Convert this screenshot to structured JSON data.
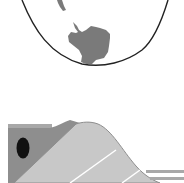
{
  "figure": {
    "colors": {
      "background": "#ffffff",
      "globe_outline": "#222222",
      "landmass": "#7a7a7a",
      "block_face": "#c8c8c8",
      "block_side": "#8e8e8e",
      "block_stripe": "#ffffff",
      "lines": "#a8a8a8",
      "dark_oval": "#111111"
    },
    "globe": {
      "label": "globe-bottom",
      "continents": [
        "antarctica",
        "south-america-tip"
      ]
    },
    "block": {
      "label": "wave-ramp-block"
    }
  }
}
